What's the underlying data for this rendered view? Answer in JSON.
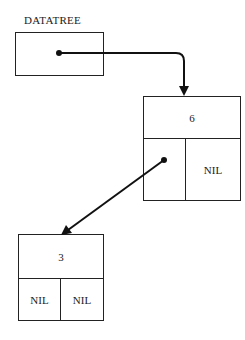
{
  "diagram": {
    "variable": {
      "label": "DATATREE"
    },
    "nodes": [
      {
        "id": "root",
        "value": "6",
        "left": "pointer",
        "right": "NIL"
      },
      {
        "id": "left-child",
        "value": "3",
        "left": "NIL",
        "right": "NIL"
      }
    ],
    "edges": [
      {
        "from": "DATATREE",
        "to": "root"
      },
      {
        "from": "root.left",
        "to": "left-child"
      }
    ]
  }
}
